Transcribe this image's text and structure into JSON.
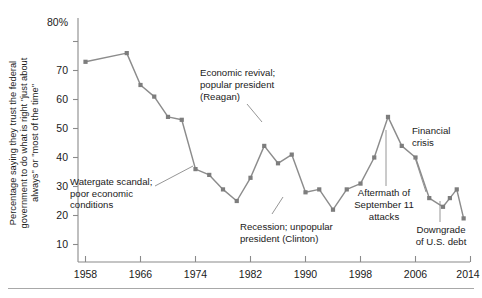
{
  "chart_data": {
    "type": "line",
    "title": "",
    "subtitle": "",
    "xlabel": "",
    "ylabel": "Percentage saying they trust the federal government to do what is right \"just about always\" or \"most of the time\"",
    "ylabel_lines": [
      "Percentage saying they trust the federal",
      "government to do what is right \"just about",
      "always\" or \"most of the time\""
    ],
    "xlim": [
      1958,
      2014
    ],
    "ylim": [
      0,
      80
    ],
    "grid": false,
    "legend": "none",
    "x_ticks": [
      "1958",
      "1966",
      "1974",
      "1982",
      "1990",
      "1998",
      "2006",
      "2014"
    ],
    "x_tick_values": [
      1958,
      1966,
      1974,
      1982,
      1990,
      1998,
      2006,
      2014
    ],
    "y_ticks": [
      "10",
      "20",
      "30",
      "40",
      "50",
      "60",
      "70",
      "80%"
    ],
    "y_tick_values": [
      10,
      20,
      30,
      40,
      50,
      60,
      70,
      80
    ],
    "series": [
      {
        "name": "Trust in federal government",
        "color": "#8c8c8c",
        "marker": "square",
        "x": [
          1958,
          1964,
          1966,
          1968,
          1970,
          1972,
          1974,
          1976,
          1978,
          1980,
          1982,
          1984,
          1986,
          1988,
          1990,
          1992,
          1994,
          1996,
          1998,
          2000,
          2002,
          2004,
          2006,
          2008,
          2010,
          2011,
          2012,
          2013
        ],
        "values": [
          73,
          76,
          65,
          61,
          54,
          53,
          36,
          34,
          29,
          25,
          33,
          44,
          38,
          41,
          28,
          29,
          22,
          29,
          31,
          40,
          54,
          44,
          40,
          26,
          23,
          26,
          29,
          19
        ]
      }
    ],
    "annotations": [
      {
        "id": "watergate",
        "lines": [
          "Watergate scandal;",
          "poor economic",
          "conditions"
        ],
        "align": "left",
        "points_to_year": 1976,
        "points_to_value": 34
      },
      {
        "id": "reagan",
        "lines": [
          "Economic revival;",
          "popular president",
          "(Reagan)"
        ],
        "align": "left",
        "points_to_year": 1984,
        "points_to_value": 44
      },
      {
        "id": "clinton",
        "lines": [
          "Recession; unpopular",
          "president (Clinton)"
        ],
        "align": "left",
        "points_to_year": 1994,
        "points_to_value": 22
      },
      {
        "id": "september-11",
        "lines": [
          "Aftermath of",
          "September 11",
          "attacks"
        ],
        "align": "center",
        "points_to_year": 2002,
        "points_to_value": 54
      },
      {
        "id": "financial-crisis",
        "lines": [
          "Financial",
          "crisis"
        ],
        "align": "left",
        "points_to_year": 2008,
        "points_to_value": 26
      },
      {
        "id": "downgrade",
        "lines": [
          "Downgrade",
          "of U.S. debt"
        ],
        "align": "center",
        "points_to_year": 2013,
        "points_to_value": 19
      }
    ],
    "colors": {
      "line": "#8c8c8c",
      "marker": "#7d7d7d",
      "axis": "#8a8a8a",
      "text": "#1a1a1a",
      "background": "#ffffff"
    }
  }
}
